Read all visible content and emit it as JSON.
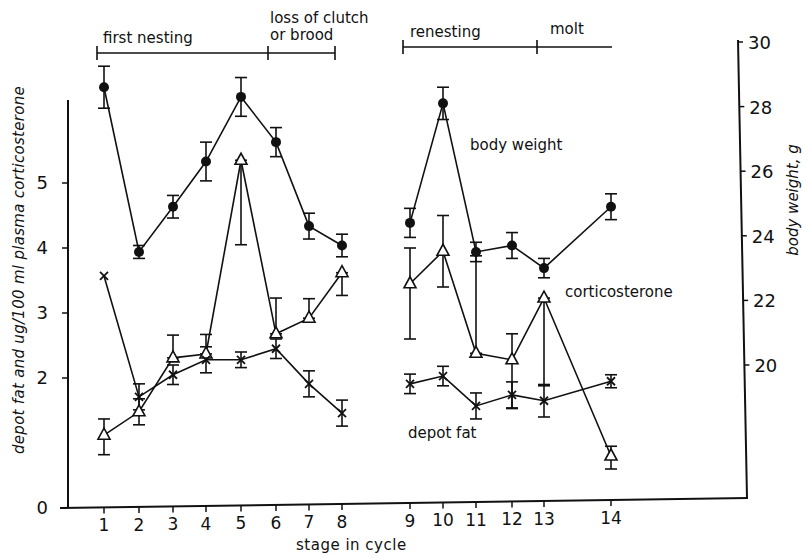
{
  "chart_data": {
    "type": "line",
    "title": "",
    "xlabel": "stage in cycle",
    "ylabel_left": "depot fat and ug/100 ml plasma corticosterone",
    "ylabel_right": "body weight, g",
    "x": [
      1,
      2,
      3,
      4,
      5,
      6,
      7,
      8,
      9,
      10,
      11,
      12,
      13,
      14
    ],
    "x_tick_labels": [
      "1",
      "2",
      "3",
      "4",
      "5",
      "6",
      "7",
      "8",
      "9",
      "10",
      "11",
      "12",
      "13",
      "14"
    ],
    "y_left_ticks": [
      "0",
      "2",
      "3",
      "4",
      "5"
    ],
    "y_left_range": [
      0,
      6.3
    ],
    "y_right_ticks": [
      "20",
      "22",
      "24",
      "26",
      "28",
      "30"
    ],
    "y_right_range": [
      16.3,
      30
    ],
    "grid": false,
    "segments_break_between": [
      8,
      9
    ],
    "series": [
      {
        "name": "body weight",
        "axis": "right",
        "marker": "filled-circle",
        "values": [
          28.6,
          23.5,
          24.9,
          26.3,
          28.3,
          26.9,
          24.3,
          23.7,
          24.4,
          28.1,
          23.5,
          23.7,
          23.0,
          24.9
        ],
        "err": [
          0.65,
          0.2,
          0.35,
          0.6,
          0.6,
          0.45,
          0.4,
          0.35,
          0.45,
          0.5,
          0.3,
          0.4,
          0.3,
          0.4
        ]
      },
      {
        "name": "corticosterone",
        "axis": "left",
        "marker": "open-triangle",
        "values": [
          1.12,
          1.48,
          2.31,
          2.37,
          5.35,
          2.68,
          2.92,
          3.62,
          3.45,
          3.95,
          2.38,
          2.28,
          3.23,
          0.8
        ],
        "err_low": [
          0.3,
          0.2,
          0.0,
          0.0,
          1.3,
          0.0,
          0.0,
          0.35,
          0.85,
          0.55,
          0.0,
          0.75,
          1.35,
          0.2
        ],
        "err_high": [
          0.25,
          0.2,
          0.35,
          0.3,
          0.0,
          0.55,
          0.3,
          0.0,
          0.55,
          0.55,
          1.5,
          0.4,
          0.0,
          0.15
        ]
      },
      {
        "name": "depot fat",
        "axis": "left",
        "marker": "x",
        "values": [
          3.57,
          1.71,
          2.05,
          2.28,
          2.28,
          2.45,
          1.91,
          1.46,
          1.91,
          2.03,
          1.57,
          1.74,
          1.65,
          1.95
        ],
        "err": [
          0.0,
          0.2,
          0.15,
          0.2,
          0.12,
          0.15,
          0.2,
          0.2,
          0.15,
          0.15,
          0.2,
          0.2,
          0.25,
          0.1
        ]
      }
    ],
    "annotations": [
      {
        "text": "first nesting",
        "from_stage": 1,
        "to_stage": 6
      },
      {
        "text": "loss of clutch or brood",
        "from_stage": 6,
        "to_stage": 8
      },
      {
        "text": "renesting",
        "from_stage": 9,
        "to_stage": 13
      },
      {
        "text": "molt",
        "from_stage": 13,
        "to_stage": 14
      }
    ]
  },
  "labels": {
    "ylabel_left": "depot fat and ug/100 ml plasma corticosterone",
    "ylabel_right": "body weight, g",
    "xlabel": "stage in cycle",
    "phase_first_nesting": "first nesting",
    "phase_loss_line1": "loss of clutch",
    "phase_loss_line2": "or brood",
    "phase_renesting": "renesting",
    "phase_molt": "molt",
    "series_body_weight": "body weight",
    "series_corticosterone": "corticosterone",
    "series_depot_fat": "depot fat"
  }
}
